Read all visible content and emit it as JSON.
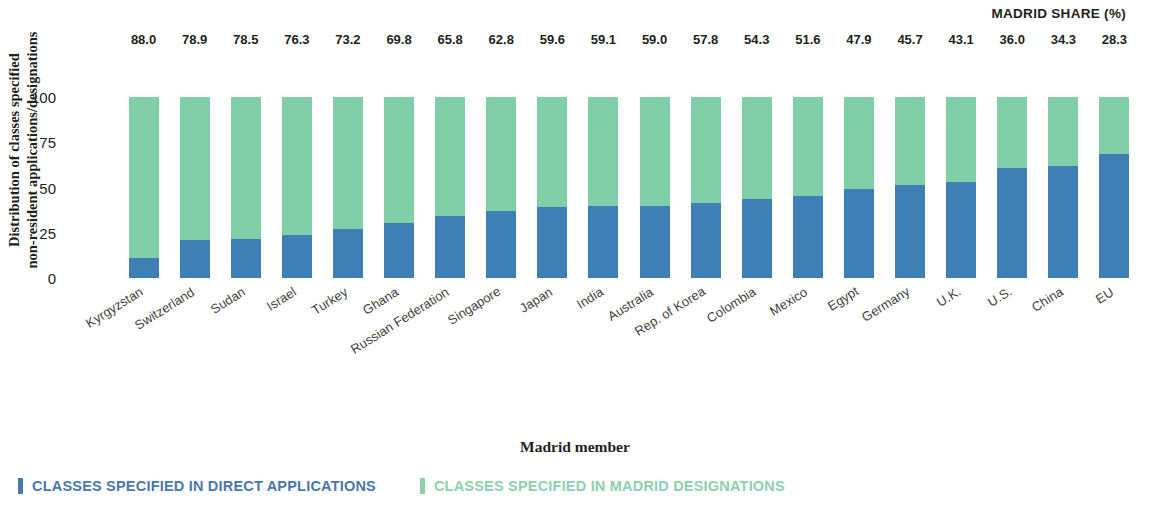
{
  "header": {
    "madrid_share_label": "MADRID SHARE (%)"
  },
  "axes": {
    "y_title": "Distribution of classes specified\nnon-resident applications/designations",
    "y_title_line1": "Distribution of classes specified",
    "y_title_line2": "non-resident applications/designations",
    "x_title": "Madrid member",
    "y_ticks": [
      "100",
      "75",
      "50",
      "25",
      "0"
    ]
  },
  "legend": {
    "items": [
      {
        "label": "CLASSES SPECIFIED IN DIRECT APPLICATIONS",
        "color": "#4a77ad",
        "swatch": "#4a77ad"
      },
      {
        "label": "CLASSES SPECIFIED IN MADRID DESIGNATIONS",
        "color": "#8ed0ad",
        "swatch": "#8ed0ad"
      }
    ]
  },
  "colors": {
    "direct_applications": "#3e7fb6",
    "madrid_designations": "#81cfa9",
    "text": "#231f20"
  },
  "chart_data": {
    "type": "bar",
    "subtype": "stacked-100",
    "title": "",
    "xlabel": "Madrid member",
    "ylabel": "Distribution of classes specified non-resident applications/designations",
    "ylim": [
      0,
      100
    ],
    "yticks": [
      0,
      25,
      50,
      75,
      100
    ],
    "grid": false,
    "legend_position": "bottom-left",
    "categories": [
      "Kyrgyzstan",
      "Switzerland",
      "Sudan",
      "Israel",
      "Turkey",
      "Ghana",
      "Russian Federation",
      "Singapore",
      "Japan",
      "India",
      "Australia",
      "Rep. of Korea",
      "Colombia",
      "Mexico",
      "Egypt",
      "Germany",
      "U.K.",
      "U.S.",
      "China",
      "EU"
    ],
    "madrid_share": [
      88.0,
      78.9,
      78.5,
      76.3,
      73.2,
      69.8,
      65.8,
      62.8,
      59.6,
      59.1,
      59.0,
      57.8,
      54.3,
      51.6,
      47.9,
      45.7,
      43.1,
      36.0,
      34.3,
      28.3
    ],
    "series": [
      {
        "name": "CLASSES SPECIFIED IN DIRECT APPLICATIONS",
        "color": "#3e7fb6",
        "values": [
          11.0,
          21.1,
          21.5,
          23.7,
          26.8,
          30.2,
          34.2,
          37.2,
          39.0,
          39.9,
          39.6,
          41.2,
          43.7,
          45.4,
          49.1,
          51.5,
          53.3,
          60.6,
          62.1,
          68.5
        ]
      },
      {
        "name": "CLASSES SPECIFIED IN MADRID DESIGNATIONS",
        "color": "#81cfa9",
        "values": [
          89.0,
          78.9,
          78.5,
          76.3,
          73.2,
          69.8,
          65.8,
          62.8,
          61.0,
          60.1,
          60.4,
          58.8,
          56.3,
          54.6,
          50.9,
          48.5,
          46.7,
          39.4,
          37.9,
          31.5
        ]
      }
    ],
    "value_labels": [
      "88.0",
      "78.9",
      "78.5",
      "76.3",
      "73.2",
      "69.8",
      "65.8",
      "62.8",
      "59.6",
      "59.1",
      "59.0",
      "57.8",
      "54.3",
      "51.6",
      "47.9",
      "45.7",
      "43.1",
      "36.0",
      "34.3",
      "28.3"
    ]
  }
}
